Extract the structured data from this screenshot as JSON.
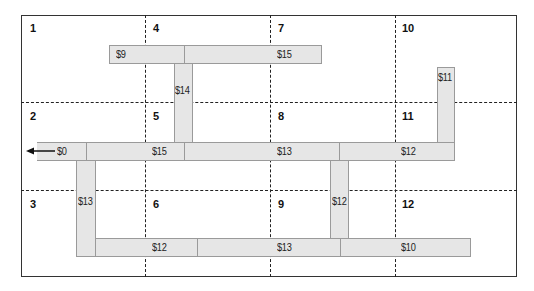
{
  "zones": [
    {
      "id": "1",
      "x": 30,
      "y": 22
    },
    {
      "id": "2",
      "x": 30,
      "y": 110
    },
    {
      "id": "3",
      "x": 30,
      "y": 198
    },
    {
      "id": "4",
      "x": 153,
      "y": 22
    },
    {
      "id": "5",
      "x": 153,
      "y": 110
    },
    {
      "id": "6",
      "x": 153,
      "y": 198
    },
    {
      "id": "7",
      "x": 278,
      "y": 22
    },
    {
      "id": "8",
      "x": 278,
      "y": 110
    },
    {
      "id": "9",
      "x": 278,
      "y": 198
    },
    {
      "id": "10",
      "x": 402,
      "y": 22
    },
    {
      "id": "11",
      "x": 402,
      "y": 110
    },
    {
      "id": "12",
      "x": 402,
      "y": 198
    }
  ],
  "costs": {
    "top_left": "$9",
    "top_right": "$15",
    "vertical_4_5": "$14",
    "vertical_10_11": "$11",
    "exit": "$0",
    "mid_5": "$15",
    "mid_8": "$13",
    "mid_11": "$12",
    "vertical_2_3": "$13",
    "vertical_8_9": "$12",
    "bottom_6": "$12",
    "bottom_9": "$13",
    "bottom_12": "$10"
  },
  "colors": {
    "road_fill": "#e6e6e6",
    "road_border": "#9a9a9a",
    "grid_line": "#222222"
  }
}
